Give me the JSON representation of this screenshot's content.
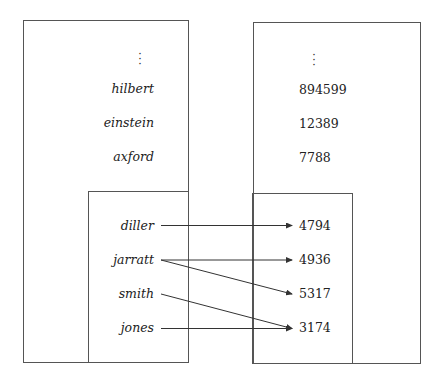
{
  "left_table": {
    "ellipsis": "⋮",
    "outer_names": [
      "hilbert",
      "einstein",
      "axford"
    ],
    "inner_names": [
      "diller",
      "jarratt",
      "smith",
      "jones"
    ]
  },
  "right_table": {
    "ellipsis": "⋮",
    "outer_values": [
      "894599",
      "12389",
      "7788"
    ],
    "inner_values": [
      "4794",
      "4936",
      "5317",
      "3174"
    ]
  },
  "mappings": [
    {
      "from": "diller",
      "to": "4794"
    },
    {
      "from": "jarratt",
      "to": "4936"
    },
    {
      "from": "jarratt",
      "to": "5317"
    },
    {
      "from": "smith",
      "to": "3174"
    },
    {
      "from": "jones",
      "to": "3174"
    }
  ],
  "colors": {
    "line": "#333333",
    "border": "#555555",
    "text": "#222222"
  }
}
